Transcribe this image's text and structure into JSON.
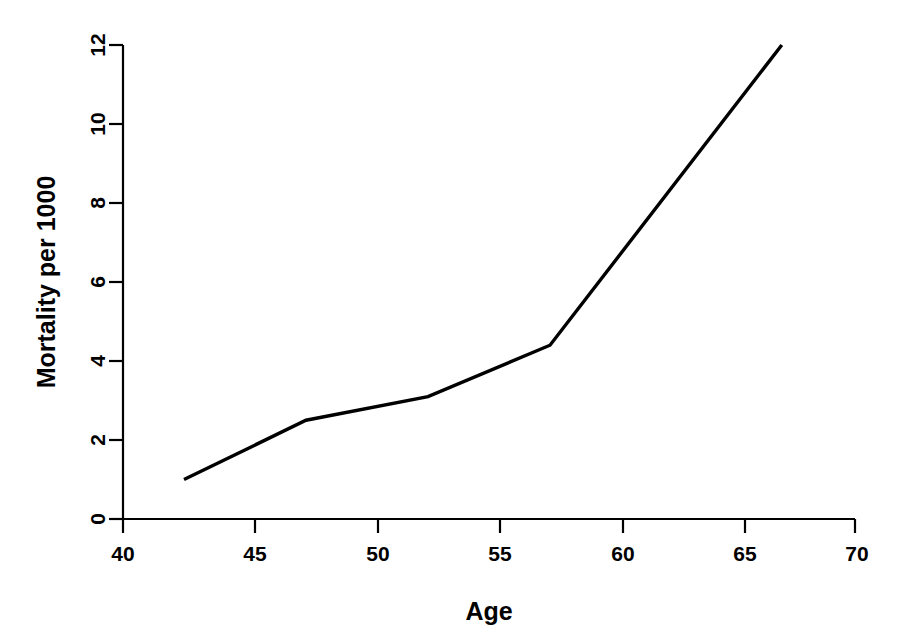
{
  "chart_data": {
    "type": "line",
    "title": "",
    "xlabel": "Age",
    "ylabel": "Mortality per 1000",
    "xlim": [
      40,
      70
    ],
    "ylim": [
      0,
      12
    ],
    "grid": false,
    "legend": null,
    "x": [
      42.5,
      47.5,
      52.5,
      57.5,
      67
    ],
    "values": [
      1.0,
      2.5,
      3.1,
      4.4,
      12.0
    ],
    "series": [
      {
        "name": "Mortality",
        "color": "#000000",
        "x": [
          42.5,
          47.5,
          52.5,
          57.5,
          67
        ],
        "values": [
          1.0,
          2.5,
          3.1,
          4.4,
          12.0
        ]
      }
    ],
    "x_ticks": [
      40,
      45,
      50,
      55,
      60,
      65,
      70
    ],
    "x_tick_labels": [
      "40",
      "45",
      "50",
      "55",
      "60",
      "65",
      "70"
    ],
    "y_ticks": [
      0,
      2,
      4,
      6,
      8,
      10,
      12
    ],
    "y_tick_labels": [
      "0",
      "2",
      "4",
      "6",
      "8",
      "10",
      "12"
    ]
  },
  "axes": {
    "x_title": "Age",
    "y_title": "Mortality per 1000"
  }
}
